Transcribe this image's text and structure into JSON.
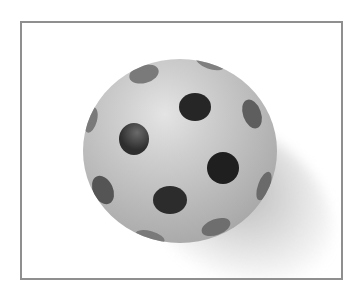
{
  "image": {
    "description": "Black and white photograph of a polka-dotted ball casting a soft shadow, enclosed in a thin gray frame",
    "subject": "polka-dot ball",
    "colors": {
      "background": "#ffffff",
      "frame": "#8f8f8f",
      "ball_highlight": "#e4e4e4",
      "ball_base": "#b9b9b9",
      "dot": "#2b2b2b"
    }
  }
}
